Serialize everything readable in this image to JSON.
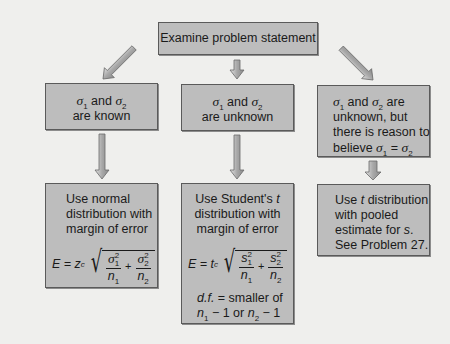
{
  "diagram": {
    "title_box": "Examine problem statement",
    "branches": [
      {
        "condition": {
          "line1_pre": "σ",
          "line1_sub1": "1",
          "line1_mid": " and ",
          "line1_sym2": "σ",
          "line1_sub2": "2",
          "line2": "are known"
        },
        "result": {
          "lines": [
            "Use normal",
            "distribution with",
            "margin of error"
          ],
          "formula": {
            "lhs": "E = z",
            "lhs_sub": "c",
            "term1_num": "σ",
            "term1_num_sup": "2",
            "term1_num_sub": "1",
            "term1_den": "n",
            "term1_den_sub": "1",
            "plus": "+",
            "term2_num": "σ",
            "term2_num_sup": "2",
            "term2_num_sub": "2",
            "term2_den": "n",
            "term2_den_sub": "2"
          }
        }
      },
      {
        "condition": {
          "line1_pre": "σ",
          "line1_sub1": "1",
          "line1_mid": " and ",
          "line1_sym2": "σ",
          "line1_sub2": "2",
          "line2": "are unknown"
        },
        "result": {
          "line1_pre": "Use Student's ",
          "line1_var": "t",
          "lines": [
            "distribution with",
            "margin of error"
          ],
          "formula": {
            "lhs": "E = t",
            "lhs_sub": "c",
            "term1_num": "s",
            "term1_num_sup": "2",
            "term1_num_sub": "1",
            "term1_den": "n",
            "term1_den_sub": "1",
            "plus": "+",
            "term2_num": "s",
            "term2_num_sup": "2",
            "term2_num_sub": "2",
            "term2_den": "n",
            "term2_den_sub": "2"
          },
          "df_label": "d.f.",
          "df_text": " = smaller of",
          "df_line2_a": "n",
          "df_line2_a_sub": "1",
          "df_line2_b": " − 1 or ",
          "df_line2_c": "n",
          "df_line2_c_sub": "2",
          "df_line2_d": " − 1"
        }
      },
      {
        "condition": {
          "line1_pre": "σ",
          "line1_sub1": "1",
          "line1_mid": " and ",
          "line1_sym2": "σ",
          "line1_sub2": "2",
          "line1_post": " are",
          "line2": "unknown, but",
          "line3": "there is reason to",
          "line4_pre": "believe ",
          "line4_a": "σ",
          "line4_a_sub": "1",
          "line4_eq": " = ",
          "line4_b": "σ",
          "line4_b_sub": "2"
        },
        "result": {
          "line1_pre": "Use ",
          "line1_var": "t",
          "line1_post": " distribution",
          "line2": "with pooled",
          "line3_pre": "estimate for ",
          "line3_var": "s",
          "line3_post": ".",
          "line4": "See Problem 27."
        }
      }
    ],
    "colors": {
      "background": "#efefed",
      "box_fill": "#bdbdbd",
      "box_border": "#5a5a5a",
      "arrow_fill": "#b0b0b0",
      "arrow_stroke": "#6a6a6a"
    }
  }
}
